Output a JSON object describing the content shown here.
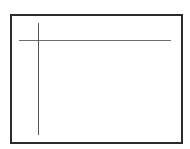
{
  "diagram": {
    "frame": {
      "label": "",
      "border_color": "#2b2b2b",
      "fill_color": "#ffffff"
    },
    "lines": [
      {
        "id": "horizontal-line",
        "orientation": "horizontal",
        "color": "#6e6e6e"
      },
      {
        "id": "vertical-line",
        "orientation": "vertical",
        "color": "#555555"
      }
    ]
  }
}
